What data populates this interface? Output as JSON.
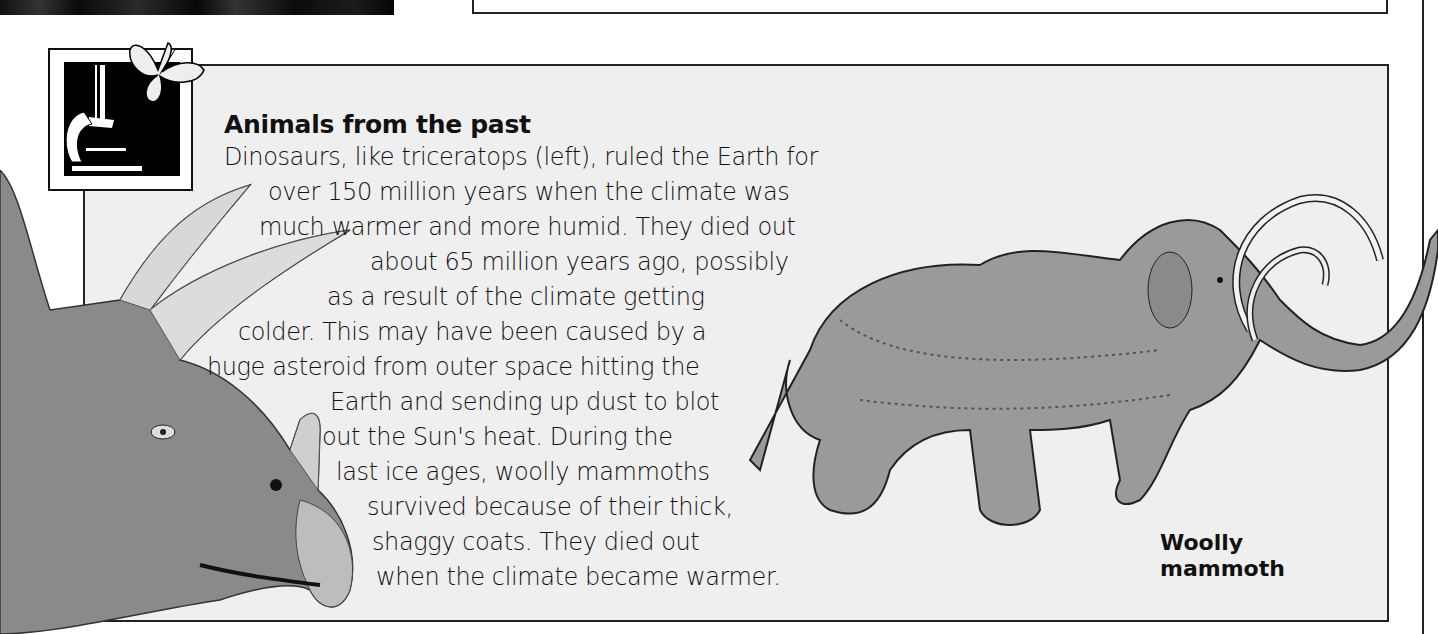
{
  "section": {
    "title": "Animals from the past",
    "body_lines": [
      "Dinosaurs, like triceratops (left), ruled the Earth for",
      "over 150 million years when the climate was",
      "much warmer and more humid. They died out",
      "about 65 million years ago, possibly",
      "as a result of the climate getting",
      "colder. This may have been caused by a",
      "huge asteroid from outer space hitting the",
      "Earth and sending up dust to blot",
      "out the Sun's heat. During the",
      "last ice ages, woolly mammoths",
      "survived because of their thick,",
      "shaggy coats. They died out",
      "when the climate became warmer."
    ]
  },
  "illustrations": {
    "mammoth_caption_line1": "Woolly",
    "mammoth_caption_line2": "mammoth",
    "left_animal": "triceratops",
    "icon": "microscope-butterfly"
  },
  "colors": {
    "box_background": "#efefef",
    "border": "#222222",
    "text": "#111111"
  }
}
